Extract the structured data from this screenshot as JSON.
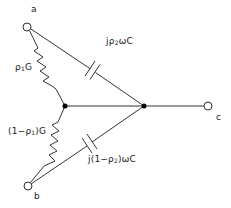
{
  "diagram": {
    "type": "circuit",
    "terminals": [
      {
        "id": "a",
        "label": "a"
      },
      {
        "id": "b",
        "label": "b"
      },
      {
        "id": "c",
        "label": "c"
      }
    ],
    "components": {
      "resistor_upper": {
        "label_prefix": "ρ",
        "label_sub": "1",
        "label_suffix": "G"
      },
      "resistor_lower": {
        "label_prefix": "(1−ρ",
        "label_sub": "1",
        "label_suffix": ")G"
      },
      "capacitor_upper": {
        "label_prefix": "jρ",
        "label_sub": "2",
        "label_suffix": "ωC"
      },
      "capacitor_lower": {
        "label_prefix": "j(1−ρ",
        "label_sub": "2",
        "label_suffix": ")ωC"
      }
    },
    "colors": {
      "line": "#333333",
      "node": "#000000",
      "background": "#ffffff"
    }
  }
}
